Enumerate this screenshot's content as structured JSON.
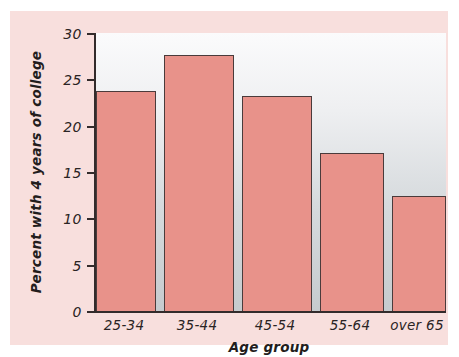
{
  "chart_data": {
    "type": "bar",
    "title": "",
    "xlabel": "Age group",
    "ylabel": "Percent with 4 years of college",
    "categories": [
      "25-34",
      "35-44",
      "45-54",
      "55-64",
      "over 65"
    ],
    "values": [
      23.7,
      27.6,
      23.2,
      17.1,
      12.4
    ],
    "ylim": [
      0,
      30
    ],
    "yticks": [
      0,
      5,
      10,
      15,
      20,
      25,
      30
    ],
    "ytick_labels": [
      "0",
      "5",
      "10",
      "15",
      "20",
      "25",
      "30"
    ],
    "grid": false,
    "legend": "none",
    "series": [
      {
        "name": "Percent with 4 years of college",
        "values": [
          23.7,
          27.6,
          23.2,
          17.1,
          12.4
        ]
      }
    ],
    "colors": {
      "bar_fill": "#e8928a",
      "bar_edge": "#4a3b3b",
      "axis": "#332b2b",
      "plot_background_top": "#fbfbfc",
      "plot_background_bottom": "#c6cbce",
      "page_background": "#f8dfdd",
      "text": "#2a2424"
    }
  }
}
